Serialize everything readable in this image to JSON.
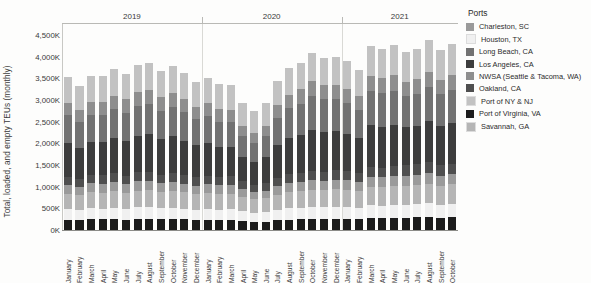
{
  "legend": {
    "title": "Ports",
    "position": "right",
    "items": [
      {
        "label": "Charleston, SC",
        "color": "#9a9a9a"
      },
      {
        "label": "Houston, TX",
        "color": "#f0f0f0"
      },
      {
        "label": "Long Beach, CA",
        "color": "#727272"
      },
      {
        "label": "Los Angeles, CA",
        "color": "#3d3d3d"
      },
      {
        "label": "NWSA (Seattle & Tacoma, WA)",
        "color": "#8e8e8e"
      },
      {
        "label": "Oakland, CA",
        "color": "#4f4f4f"
      },
      {
        "label": "Port of NY & NJ",
        "color": "#c2c2c2"
      },
      {
        "label": "Port of Virginia, VA",
        "color": "#1c1c1c"
      },
      {
        "label": "Savannah, GA",
        "color": "#b5b5b5"
      }
    ]
  },
  "axes": {
    "ylabel": "Total, loaded, and empty TEUs (monthly)",
    "yticks": [
      "0K",
      "500K",
      "1,000K",
      "1,500K",
      "2,000K",
      "2,500K",
      "3,000K",
      "3,500K",
      "4,000K",
      "4,500K"
    ],
    "ytick_values": [
      0,
      500000,
      1000000,
      1500000,
      2000000,
      2500000,
      3000000,
      3500000,
      4000000,
      4500000
    ],
    "ylim": [
      0,
      4750000
    ],
    "years": [
      "2019",
      "2020",
      "2021"
    ]
  },
  "chart_data": {
    "type": "bar",
    "stacked": true,
    "title": "",
    "xlabel": "",
    "ylabel": "Total, loaded, and empty TEUs (monthly)",
    "ylim": [
      0,
      4750000
    ],
    "grid": false,
    "legend_position": "right",
    "unit": "TEU",
    "categories": [
      "January",
      "February",
      "March",
      "April",
      "May",
      "June",
      "July",
      "August",
      "September",
      "October",
      "November",
      "December",
      "January",
      "February",
      "March",
      "April",
      "May",
      "June",
      "July",
      "August",
      "September",
      "October",
      "November",
      "December",
      "January",
      "February",
      "March",
      "April",
      "May",
      "June",
      "July",
      "August",
      "September",
      "October"
    ],
    "year_groups": [
      {
        "year": "2019",
        "start_index": 0,
        "count": 12
      },
      {
        "year": "2020",
        "start_index": 12,
        "count": 12
      },
      {
        "year": "2021",
        "start_index": 24,
        "count": 10
      }
    ],
    "series": [
      {
        "name": "Port of Virginia, VA",
        "color": "#1c1c1c",
        "values": [
          232000,
          228000,
          246000,
          244000,
          252000,
          242000,
          258000,
          262000,
          248000,
          256000,
          244000,
          232000,
          236000,
          228000,
          226000,
          206000,
          190000,
          196000,
          224000,
          242000,
          252000,
          262000,
          258000,
          264000,
          258000,
          252000,
          282000,
          276000,
          284000,
          286000,
          292000,
          300000,
          286000,
          296000
        ]
      },
      {
        "name": "Houston, TX",
        "color": "#f0f0f0",
        "values": [
          242000,
          226000,
          256000,
          252000,
          258000,
          248000,
          262000,
          264000,
          250000,
          262000,
          250000,
          238000,
          248000,
          244000,
          252000,
          228000,
          212000,
          218000,
          240000,
          258000,
          262000,
          272000,
          268000,
          276000,
          272000,
          264000,
          292000,
          288000,
          296000,
          298000,
          304000,
          312000,
          298000,
          306000
        ]
      },
      {
        "name": "Savannah, GA",
        "color": "#b5b5b5",
        "values": [
          358000,
          344000,
          372000,
          368000,
          382000,
          366000,
          388000,
          392000,
          374000,
          386000,
          372000,
          356000,
          368000,
          360000,
          364000,
          332000,
          310000,
          318000,
          352000,
          376000,
          384000,
          398000,
          392000,
          402000,
          398000,
          386000,
          428000,
          420000,
          432000,
          436000,
          444000,
          456000,
          436000,
          448000
        ]
      },
      {
        "name": "Charleston, SC",
        "color": "#9a9a9a",
        "values": [
          196000,
          188000,
          204000,
          202000,
          208000,
          200000,
          212000,
          214000,
          204000,
          210000,
          202000,
          194000,
          200000,
          196000,
          198000,
          182000,
          170000,
          174000,
          192000,
          204000,
          208000,
          216000,
          212000,
          218000,
          216000,
          210000,
          232000,
          228000,
          234000,
          236000,
          240000,
          246000,
          236000,
          242000
        ]
      },
      {
        "name": "Oakland, CA",
        "color": "#4f4f4f",
        "values": [
          196000,
          188000,
          202000,
          200000,
          208000,
          198000,
          210000,
          214000,
          202000,
          210000,
          200000,
          192000,
          198000,
          194000,
          196000,
          180000,
          168000,
          172000,
          190000,
          202000,
          206000,
          214000,
          210000,
          216000,
          214000,
          208000,
          230000,
          226000,
          232000,
          234000,
          238000,
          244000,
          234000,
          240000
        ]
      },
      {
        "name": "Los Angeles, CA",
        "color": "#3d3d3d",
        "values": [
          780000,
          712000,
          760000,
          768000,
          812000,
          800000,
          840000,
          860000,
          812000,
          838000,
          796000,
          738000,
          760000,
          702000,
          688000,
          568000,
          530000,
          600000,
          762000,
          840000,
          880000,
          950000,
          920000,
          900000,
          866000,
          800000,
          958000,
          946000,
          956000,
          876000,
          890000,
          956000,
          902000,
          934000
        ]
      },
      {
        "name": "Long Beach, CA",
        "color": "#727272",
        "values": [
          642000,
          598000,
          622000,
          626000,
          660000,
          652000,
          686000,
          702000,
          664000,
          686000,
          652000,
          606000,
          622000,
          578000,
          566000,
          470000,
          438000,
          492000,
          622000,
          686000,
          720000,
          778000,
          752000,
          736000,
          708000,
          654000,
          784000,
          774000,
          782000,
          716000,
          728000,
          782000,
          738000,
          764000
        ]
      },
      {
        "name": "NWSA (Seattle & Tacoma, WA)",
        "color": "#8e8e8e",
        "values": [
          296000,
          280000,
          298000,
          300000,
          312000,
          306000,
          318000,
          326000,
          310000,
          320000,
          306000,
          288000,
          296000,
          280000,
          274000,
          238000,
          222000,
          240000,
          292000,
          318000,
          332000,
          352000,
          342000,
          336000,
          326000,
          306000,
          356000,
          352000,
          356000,
          332000,
          336000,
          356000,
          340000,
          350000
        ]
      },
      {
        "name": "Port of NY & NJ",
        "color": "#c2c2c2",
        "values": [
          580000,
          556000,
          596000,
          592000,
          612000,
          592000,
          622000,
          630000,
          602000,
          620000,
          596000,
          570000,
          588000,
          576000,
          580000,
          532000,
          496000,
          510000,
          564000,
          600000,
          612000,
          634000,
          622000,
          640000,
          634000,
          616000,
          682000,
          670000,
          688000,
          694000,
          706000,
          724000,
          692000,
          712000
        ]
      }
    ]
  }
}
